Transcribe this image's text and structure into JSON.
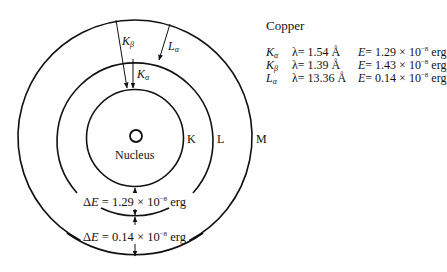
{
  "legend": {
    "title": "Copper",
    "rows": [
      {
        "line": "K",
        "line_sub": "α",
        "lambda_label": "λ",
        "lambda_value": "= 1.54 Å",
        "energy_label": "E",
        "energy_value": "= 1.29 × 10",
        "energy_exp": "−8",
        "energy_unit": " erg"
      },
      {
        "line": "K",
        "line_sub": "β",
        "lambda_label": "λ",
        "lambda_value": "= 1.39 Å",
        "energy_label": "E",
        "energy_value": "= 1.43 × 10",
        "energy_exp": "−8",
        "energy_unit": " erg"
      },
      {
        "line": "L",
        "line_sub": "α",
        "lambda_label": "λ",
        "lambda_value": "= 13.36 Å",
        "energy_label": "E",
        "energy_value": "= 0.14 × 10",
        "energy_exp": "−8",
        "energy_unit": " erg"
      }
    ]
  },
  "shells": {
    "k": "K",
    "l": "L",
    "m": "M"
  },
  "nucleus": {
    "label": "Nucleus"
  },
  "transitions": {
    "k_beta": {
      "symbol": "K",
      "sub": "β"
    },
    "k_alpha": {
      "symbol": "K",
      "sub": "α"
    },
    "l_alpha": {
      "symbol": "L",
      "sub": "α"
    }
  },
  "energy_gaps": {
    "kl": {
      "delta": "Δ",
      "symbol": "E",
      "value": " = 1.29 × 10",
      "exp": "−8",
      "unit": " erg"
    },
    "lm": {
      "delta": "Δ",
      "symbol": "E",
      "value": " = 0.14 × 10",
      "exp": "−8",
      "unit": " erg"
    }
  },
  "colors": {
    "stroke": "#111111",
    "background": "#ffffff"
  }
}
